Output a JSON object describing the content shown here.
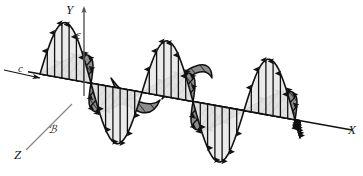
{
  "figure": {
    "name": "electromagnetic-plane-wave",
    "background_color": "#ffffff",
    "axes": {
      "x_label": "X",
      "y_label": "Y",
      "z_label": "Z"
    },
    "fields": {
      "electric": {
        "symbol": "ε",
        "fill_color": "#e9e9e9",
        "stroke_color": "#111111",
        "arrow_color": "#111111",
        "orientation": "vertical",
        "wavelength_px": 102,
        "amplitude_px": 56,
        "cycles": 2.55
      },
      "magnetic": {
        "symbol": "ℬ",
        "fill_color": "#8d8d8d",
        "stroke_color": "#111111",
        "hatch_color": "#1d1d1d",
        "orientation": "perspective-diagonal",
        "wavelength_px": 102,
        "amplitude_px": 40,
        "cycles": 2.55
      }
    },
    "propagation": {
      "symbol": "c",
      "description": "propagation-direction-arrow"
    }
  },
  "chart_data": {
    "type": "line",
    "title": "",
    "xlabel": "X",
    "ylabel": "Y",
    "series": [
      {
        "name": "ε",
        "axis": "Y",
        "values": [
          0,
          56,
          0,
          -56,
          0,
          56,
          0,
          -56,
          0,
          56,
          0
        ]
      },
      {
        "name": "ℬ",
        "axis": "Z",
        "values": [
          0,
          40,
          0,
          -40,
          0,
          40,
          0,
          -40,
          0,
          40,
          0
        ]
      }
    ],
    "x": [
      0,
      0.25,
      0.5,
      0.75,
      1.0,
      1.25,
      1.5,
      1.75,
      2.0,
      2.25,
      2.5
    ],
    "grid": false,
    "legend": "none"
  }
}
